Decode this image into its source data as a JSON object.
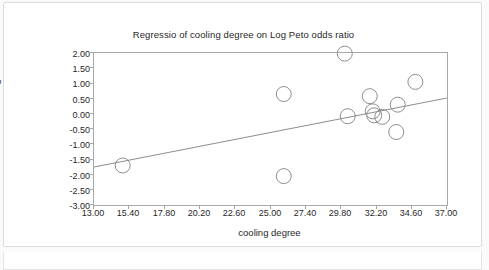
{
  "chart_data": {
    "type": "scatter",
    "title": "Regressio of cooling degree on Log Peto odds ratio",
    "xlabel": "cooling degree",
    "ylabel": "Log Peto odds ratio",
    "xlim": [
      13.0,
      37.0
    ],
    "ylim": [
      -3.0,
      2.0
    ],
    "xticks": [
      "13.00",
      "15.40",
      "17.80",
      "20.20",
      "22.60",
      "25.00",
      "27.40",
      "29.80",
      "32.20",
      "34.60",
      "37.00"
    ],
    "yticks": [
      "2.00",
      "1.50",
      "1.00",
      "0.50",
      "0.00",
      "-0.50",
      "-1.00",
      "-1.50",
      "-2.00",
      "-2.50",
      "-3.00"
    ],
    "grid": false,
    "legend": "none",
    "marker": "open-circle",
    "points": [
      {
        "x": 14.95,
        "y": -1.7
      },
      {
        "x": 25.9,
        "y": 0.65
      },
      {
        "x": 25.9,
        "y": -2.05
      },
      {
        "x": 30.05,
        "y": 1.98
      },
      {
        "x": 30.25,
        "y": -0.08
      },
      {
        "x": 31.75,
        "y": 0.58
      },
      {
        "x": 31.95,
        "y": 0.08
      },
      {
        "x": 32.05,
        "y": -0.05
      },
      {
        "x": 32.6,
        "y": -0.1
      },
      {
        "x": 33.65,
        "y": 0.3
      },
      {
        "x": 33.55,
        "y": -0.6
      },
      {
        "x": 34.85,
        "y": 1.05
      }
    ],
    "fit_line": {
      "label": "regression-line",
      "x_start": 13.0,
      "y_start": -1.75,
      "x_end": 37.0,
      "y_end": 0.52
    }
  },
  "caption": {
    "cutoff_text": ""
  }
}
